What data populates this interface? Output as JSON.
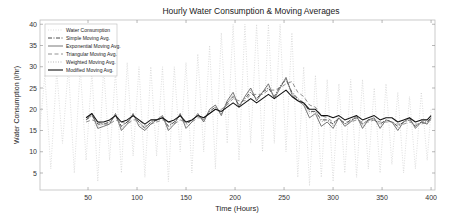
{
  "chart_data": {
    "type": "line",
    "title": "Hourly Water Consumption & Moving Averages",
    "xlabel": "Time (Hours)",
    "ylabel": "Water Consumption (l/hr)",
    "xlim": [
      1,
      404
    ],
    "ylim": [
      1,
      41
    ],
    "xticks": [
      50,
      100,
      150,
      200,
      250,
      300,
      350,
      400
    ],
    "yticks": [
      5,
      10,
      15,
      20,
      25,
      30,
      35,
      40
    ],
    "grid": false,
    "legend_position": "upper left",
    "legend": [
      "Water Consumption",
      "Simple Moving Avg.",
      "Exponential Moving Avg.",
      "Triangular Moving Avg.",
      "Weighted Moving Avg.",
      "Modified Moving Avg."
    ],
    "series": [
      {
        "name": "Water Consumption",
        "style": "dotted",
        "color": "#c8c8c8",
        "x": [
          1,
          6,
          12,
          18,
          24,
          30,
          36,
          42,
          48,
          54,
          60,
          66,
          72,
          78,
          84,
          90,
          96,
          102,
          108,
          114,
          120,
          126,
          132,
          138,
          144,
          150,
          156,
          162,
          168,
          174,
          180,
          186,
          192,
          198,
          204,
          210,
          216,
          222,
          228,
          234,
          240,
          246,
          252,
          258,
          264,
          270,
          276,
          282,
          288,
          294,
          300,
          306,
          312,
          318,
          324,
          330,
          336,
          342,
          348,
          354,
          360,
          366,
          372,
          378,
          384,
          390,
          396,
          400
        ],
        "y": [
          16,
          28,
          6,
          29,
          12,
          30,
          5,
          30,
          8,
          29,
          3,
          30,
          8,
          29,
          5,
          31,
          9,
          30,
          4,
          30,
          9,
          30,
          3,
          30,
          10,
          31,
          5,
          33,
          10,
          35,
          6,
          38,
          12,
          40,
          8,
          40,
          12,
          40,
          10,
          40,
          12,
          40,
          10,
          38,
          4,
          30,
          2,
          28,
          4,
          27,
          3,
          26,
          5,
          27,
          4,
          27,
          6,
          25,
          5,
          26,
          7,
          24,
          5,
          23,
          6,
          24,
          8,
          20
        ]
      },
      {
        "name": "Simple Moving Avg.",
        "style": "dashdot",
        "color": "#333333",
        "x": [
          48,
          54,
          60,
          66,
          72,
          78,
          84,
          90,
          96,
          102,
          108,
          114,
          120,
          126,
          132,
          138,
          144,
          150,
          156,
          162,
          168,
          174,
          180,
          186,
          192,
          198,
          204,
          210,
          216,
          222,
          228,
          234,
          240,
          246,
          252,
          258,
          264,
          270,
          276,
          282,
          288,
          294,
          300,
          306,
          312,
          318,
          324,
          330,
          336,
          342,
          348,
          354,
          360,
          366,
          372,
          378,
          384,
          390,
          396,
          400
        ],
        "y": [
          17.5,
          18.5,
          16.5,
          16.5,
          17,
          18.5,
          16,
          17,
          18.5,
          17,
          15.5,
          17,
          17.5,
          18,
          16,
          17,
          18.5,
          16.5,
          17.5,
          18.5,
          17.5,
          19.5,
          20.5,
          19,
          21.5,
          23,
          21,
          22.5,
          24,
          22.5,
          24,
          25,
          23,
          25.5,
          27,
          24,
          22.5,
          21.5,
          19.5,
          19.5,
          17.5,
          17.5,
          16.5,
          18,
          16.5,
          17.5,
          18,
          16.5,
          17.5,
          17.5,
          16.5,
          17.5,
          17,
          16,
          17,
          17.5,
          16,
          17,
          17,
          18
        ]
      },
      {
        "name": "Exponential Moving Avg.",
        "style": "solid",
        "color": "#555555",
        "x": [
          48,
          54,
          60,
          66,
          72,
          78,
          84,
          90,
          96,
          102,
          108,
          114,
          120,
          126,
          132,
          138,
          144,
          150,
          156,
          162,
          168,
          174,
          180,
          186,
          192,
          198,
          204,
          210,
          216,
          222,
          228,
          234,
          240,
          246,
          252,
          258,
          264,
          270,
          276,
          282,
          288,
          294,
          300,
          306,
          312,
          318,
          324,
          330,
          336,
          342,
          348,
          354,
          360,
          366,
          372,
          378,
          384,
          390,
          396,
          400
        ],
        "y": [
          17.5,
          19,
          15.5,
          16,
          16.5,
          19,
          15,
          16.5,
          19,
          16,
          15,
          16.5,
          17.5,
          18.5,
          15,
          16.5,
          19,
          15.5,
          17,
          19,
          17,
          20,
          21,
          18.5,
          22,
          24,
          20.5,
          23,
          25,
          22,
          24,
          26,
          22.5,
          25,
          27.5,
          23.5,
          22,
          21,
          18,
          19,
          16,
          17,
          15.5,
          18,
          16,
          17,
          18.5,
          15.5,
          17.5,
          18,
          15.5,
          17.5,
          17,
          15,
          17,
          18,
          15.5,
          17,
          16.5,
          18
        ]
      },
      {
        "name": "Triangular Moving Avg.",
        "style": "dashed",
        "color": "#777777",
        "x": [
          48,
          54,
          60,
          66,
          72,
          78,
          84,
          90,
          96,
          102,
          108,
          114,
          120,
          126,
          132,
          138,
          144,
          150,
          156,
          162,
          168,
          174,
          180,
          186,
          192,
          198,
          204,
          210,
          216,
          222,
          228,
          234,
          240,
          246,
          252,
          258,
          264,
          270,
          276,
          282,
          288,
          294,
          300,
          306,
          312,
          318,
          324,
          330,
          336,
          342,
          348,
          354,
          360,
          366,
          372,
          378,
          384,
          390,
          396,
          400
        ],
        "y": [
          17,
          17.5,
          17,
          16.5,
          16.5,
          17.5,
          17,
          16.5,
          17.5,
          17.5,
          16,
          16.5,
          17,
          17.5,
          17,
          16.5,
          17.5,
          17,
          17,
          18,
          18,
          19,
          20,
          20,
          21,
          22.5,
          22,
          22,
          23.5,
          23.5,
          23.5,
          24.5,
          24.5,
          25,
          26,
          26.5,
          24,
          23,
          21,
          20.5,
          18.5,
          18,
          17,
          17.5,
          17,
          17,
          17.5,
          17,
          17,
          17.5,
          17,
          17,
          17,
          16.5,
          16.5,
          17,
          16.5,
          16.5,
          17,
          17.5
        ]
      },
      {
        "name": "Weighted Moving Avg.",
        "style": "dotted",
        "color": "#999999",
        "x": [
          48,
          54,
          60,
          66,
          72,
          78,
          84,
          90,
          96,
          102,
          108,
          114,
          120,
          126,
          132,
          138,
          144,
          150,
          156,
          162,
          168,
          174,
          180,
          186,
          192,
          198,
          204,
          210,
          216,
          222,
          228,
          234,
          240,
          246,
          252,
          258,
          264,
          270,
          276,
          282,
          288,
          294,
          300,
          306,
          312,
          318,
          324,
          330,
          336,
          342,
          348,
          354,
          360,
          366,
          372,
          378,
          384,
          390,
          396,
          400
        ],
        "y": [
          17.5,
          18.5,
          16,
          16.5,
          17,
          18.5,
          15.5,
          16.5,
          18.5,
          16.5,
          15.5,
          17,
          17.5,
          18,
          15.5,
          17,
          18.5,
          16,
          17.5,
          18.5,
          17.5,
          19.5,
          20.5,
          19,
          21.5,
          23.5,
          21,
          22.5,
          24.5,
          22.5,
          24,
          25.5,
          23,
          25,
          27,
          24,
          22,
          21,
          19,
          19.5,
          17,
          17.5,
          16,
          18,
          16.5,
          17,
          18,
          16,
          17.5,
          17.5,
          16,
          17.5,
          17,
          15.5,
          17,
          17.5,
          16,
          17,
          16.5,
          18
        ]
      },
      {
        "name": "Modified Moving Avg.",
        "style": "solid",
        "color": "#111111",
        "x": [
          48,
          54,
          60,
          66,
          72,
          78,
          84,
          90,
          96,
          102,
          108,
          114,
          120,
          126,
          132,
          138,
          144,
          150,
          156,
          162,
          168,
          174,
          180,
          186,
          192,
          198,
          204,
          210,
          216,
          222,
          228,
          234,
          240,
          246,
          252,
          258,
          264,
          270,
          276,
          282,
          288,
          294,
          300,
          306,
          312,
          318,
          324,
          330,
          336,
          342,
          348,
          354,
          360,
          366,
          372,
          378,
          384,
          390,
          396,
          400
        ],
        "y": [
          18,
          19,
          17,
          17,
          17.5,
          18.5,
          17,
          17.5,
          18.5,
          17.5,
          16.5,
          17.5,
          17.5,
          18,
          17,
          17.5,
          18.5,
          17,
          17.5,
          18.5,
          18,
          19,
          20,
          19.5,
          20.5,
          21.5,
          20.5,
          21.5,
          22.5,
          21.5,
          22.5,
          23.5,
          22.5,
          23.5,
          24.5,
          23,
          22,
          21.5,
          20,
          20,
          18.5,
          18.5,
          18,
          18.5,
          17.5,
          18,
          18.5,
          17.5,
          18,
          18.5,
          17.5,
          18,
          18,
          17,
          17.5,
          18,
          17,
          17.5,
          17.5,
          18.5
        ]
      }
    ]
  }
}
